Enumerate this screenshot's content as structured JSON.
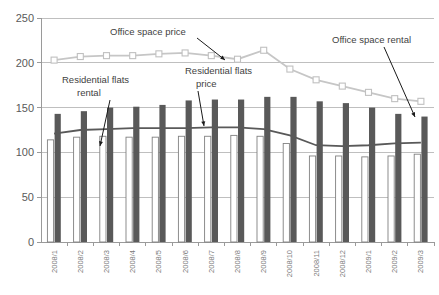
{
  "chart_data": {
    "type": "bar",
    "title": "",
    "subtitle": "",
    "xlabel": "",
    "ylabel": "",
    "ylim": [
      0,
      250
    ],
    "yticks": [
      0,
      50,
      100,
      150,
      200,
      250
    ],
    "grid": true,
    "legend_position": "none",
    "categories": [
      "2008/1",
      "2008/2",
      "2008/3",
      "2008/4",
      "2008/5",
      "2008/6",
      "2008/7",
      "2008/8",
      "2008/9",
      "2008/10",
      "2008/11",
      "2008/12",
      "2009/1",
      "2009/2",
      "2009/3"
    ],
    "series": [
      {
        "name": "Residential flats rental",
        "type": "bar",
        "style": "outlined-white",
        "values": [
          114,
          117,
          118,
          117,
          117,
          118,
          118,
          119,
          118,
          110,
          96,
          96,
          95,
          96,
          98
        ]
      },
      {
        "name": "Office space rental",
        "type": "bar",
        "style": "solid-dark",
        "values": [
          143,
          146,
          150,
          151,
          153,
          158,
          159,
          159,
          162,
          162,
          157,
          155,
          150,
          143,
          140
        ]
      },
      {
        "name": "Residential flats price",
        "type": "line",
        "style": "dark-line",
        "values": [
          121,
          125,
          126,
          127,
          127,
          127,
          128,
          128,
          126,
          119,
          108,
          107,
          108,
          110,
          111
        ]
      },
      {
        "name": "Office space price",
        "type": "line",
        "style": "light-line-square-markers",
        "values": [
          203,
          207,
          208,
          208,
          210,
          211,
          208,
          204,
          214,
          193,
          181,
          174,
          167,
          160,
          157
        ]
      }
    ],
    "annotations": [
      {
        "id": "anno-office-space-price",
        "text": "Office space price",
        "points_to_series": "Office space price",
        "points_to_index": 7
      },
      {
        "id": "anno-office-space-rental",
        "text": "Office space rental",
        "points_to_series": "Office space rental",
        "points_to_index": 14
      },
      {
        "id": "anno-residential-flats-rental",
        "text": "Residential flats\nrental",
        "line1": "Residential flats",
        "line2": "rental",
        "points_to_series": "Residential flats rental",
        "points_to_index": 2
      },
      {
        "id": "anno-residential-flats-price",
        "text": "Residential flats\nprice",
        "line1": "Residential flats",
        "line2": "price",
        "points_to_series": "Residential flats price",
        "points_to_index": 6
      }
    ],
    "colors": {
      "bar_dark": "#595959",
      "bar_white_fill": "#ffffff",
      "bar_white_stroke": "#808080",
      "line_light": "#c6c6c6",
      "line_dark": "#595959",
      "gridline": "#bfbfbf",
      "tick_text": "#5a5a5a"
    }
  }
}
